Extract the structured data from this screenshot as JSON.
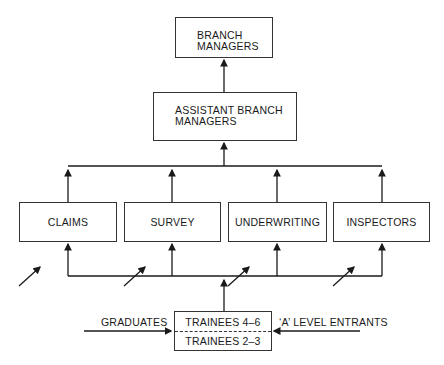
{
  "diagram": {
    "type": "career progression flowchart",
    "nodes": {
      "branch_managers": {
        "line1": "BRANCH",
        "line2": "MANAGERS"
      },
      "assistant_branch_managers": {
        "line1": "ASSISTANT BRANCH",
        "line2": "MANAGERS"
      },
      "departments": [
        {
          "label": "CLAIMS"
        },
        {
          "label": "SURVEY"
        },
        {
          "label": "UNDERWRITING"
        },
        {
          "label": "INSPECTORS"
        }
      ],
      "trainees": {
        "upper": "TRAINEES 4–6",
        "lower": "TRAINEES 2–3"
      }
    },
    "inputs": {
      "left": "GRADUATES",
      "right": "‘A’ LEVEL ENTRANTS"
    },
    "colors": {
      "line": "#1a1a1a",
      "background": "#ffffff"
    }
  }
}
